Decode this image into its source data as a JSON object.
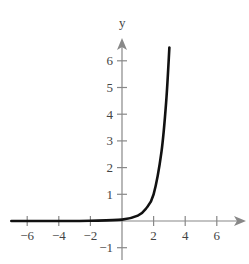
{
  "chart_data": {
    "type": "line",
    "title": "",
    "xlabel": "",
    "ylabel": "y",
    "xlim": [
      -7.2,
      7.8
    ],
    "ylim": [
      -1.5,
      7.2
    ],
    "x_ticks": [
      -6,
      -4,
      -2,
      2,
      4,
      6
    ],
    "y_ticks": [
      -1,
      1,
      2,
      3,
      4,
      5,
      6
    ],
    "x_tick_labels": [
      "−6",
      "−4",
      "−2",
      "2",
      "4",
      "6"
    ],
    "y_tick_labels": [
      "−1",
      "1",
      "2",
      "3",
      "4",
      "5",
      "6"
    ],
    "grid": false,
    "legend": null,
    "series": [
      {
        "name": "curve",
        "x": [
          -7,
          -6,
          -4,
          -2,
          0,
          1,
          1.5,
          2,
          2.5,
          2.8,
          3.0
        ],
        "y": [
          0.0,
          0.0,
          0.0,
          0.01,
          0.05,
          0.2,
          0.45,
          1.0,
          2.6,
          4.5,
          6.5
        ]
      }
    ]
  }
}
